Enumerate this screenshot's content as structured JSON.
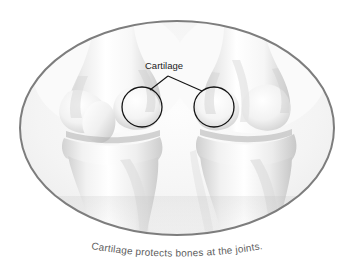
{
  "figure": {
    "caption": "Cartilage protects bones at the joints.",
    "annotation_label": "Cartilage",
    "frame": {
      "shape": "ellipse",
      "center_x": 177,
      "center_y": 128,
      "radius_x": 158,
      "radius_y": 108,
      "border_color": "#7d7d7d",
      "border_width": 2,
      "fill_color": "#f4f4f4"
    },
    "background_color": "#ffffff",
    "callouts": [
      {
        "name": "left-cartilage-circle",
        "center_x": 142,
        "center_y": 107,
        "radius": 20,
        "stroke_color": "#141414"
      },
      {
        "name": "right-cartilage-circle",
        "center_x": 214,
        "center_y": 107,
        "radius": 20,
        "stroke_color": "#141414"
      }
    ],
    "leader_lines": {
      "vertex_x": 168,
      "vertex_y": 76,
      "left_end_x": 150,
      "left_end_y": 90,
      "right_end_x": 202,
      "right_end_y": 91,
      "stroke_color": "#141414"
    },
    "label_position": {
      "x": 164,
      "y": 69
    },
    "anatomy": [
      {
        "name": "left-femur",
        "description": "Left knee upper thigh bone with condyles"
      },
      {
        "name": "left-patella",
        "description": "Left knee kneecap"
      },
      {
        "name": "left-tibia",
        "description": "Left knee shin bone"
      },
      {
        "name": "right-femur",
        "description": "Right knee upper thigh bone with condyles"
      },
      {
        "name": "right-tibia",
        "description": "Right knee shin bone"
      }
    ]
  }
}
